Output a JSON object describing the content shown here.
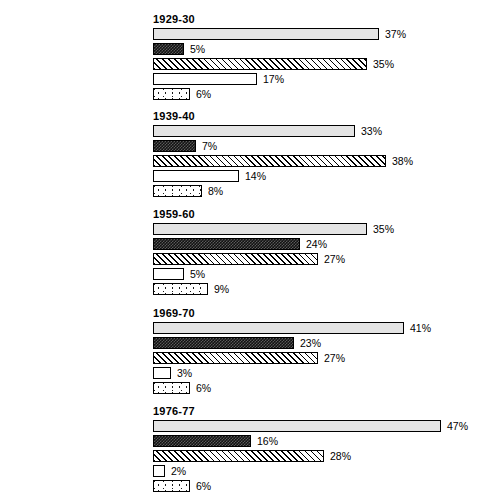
{
  "chart_data": {
    "type": "bar",
    "orientation": "horizontal",
    "title": "",
    "xlabel": "",
    "ylabel": "",
    "xlim": [
      0,
      50
    ],
    "grid": false,
    "legend_position": "none",
    "value_suffix": "%",
    "categories": [
      "State & local governments",
      "Federal government",
      "Tuition & fees",
      "Endowment income",
      "Private gifts & grants"
    ],
    "category_patterns": [
      "stipple-light",
      "checker-dark",
      "diagonal-hatch",
      "plain-white",
      "scattered-dots"
    ],
    "groups": [
      {
        "label": "1929-30",
        "values": [
          37,
          5,
          35,
          17,
          6
        ],
        "value_labels": [
          "37%",
          "5%",
          "35%",
          "17%",
          "6%"
        ]
      },
      {
        "label": "1939-40",
        "values": [
          33,
          7,
          38,
          14,
          8
        ],
        "value_labels": [
          "33%",
          "7%",
          "38%",
          "14%",
          "8%"
        ]
      },
      {
        "label": "1959-60",
        "values": [
          35,
          24,
          27,
          5,
          9
        ],
        "value_labels": [
          "35%",
          "24%",
          "27%",
          "5%",
          "9%"
        ]
      },
      {
        "label": "1969-70",
        "values": [
          41,
          23,
          27,
          3,
          6
        ],
        "value_labels": [
          "41%",
          "23%",
          "27%",
          "3%",
          "6%"
        ]
      },
      {
        "label": "1976-77",
        "values": [
          47,
          16,
          28,
          2,
          6
        ],
        "value_labels": [
          "47%",
          "16%",
          "28%",
          "2%",
          "6%"
        ]
      }
    ],
    "series": [
      {
        "name": "State & local governments",
        "values": [
          37,
          33,
          35,
          41,
          47
        ]
      },
      {
        "name": "Federal government",
        "values": [
          5,
          7,
          24,
          23,
          16
        ]
      },
      {
        "name": "Tuition & fees",
        "values": [
          35,
          38,
          27,
          27,
          28
        ]
      },
      {
        "name": "Endowment income",
        "values": [
          17,
          14,
          5,
          3,
          2
        ]
      },
      {
        "name": "Private gifts & grants",
        "values": [
          6,
          8,
          9,
          6,
          6
        ]
      }
    ]
  },
  "layout": {
    "bar_left_px": 153,
    "px_per_percent": 6.12,
    "group_tops": [
      13,
      110,
      208,
      307,
      405
    ],
    "first_bar_offset": 14,
    "row_height": 15
  }
}
